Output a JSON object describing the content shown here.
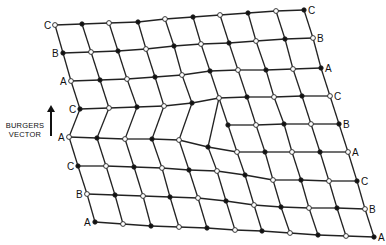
{
  "diagram": {
    "burgers_vector_label": [
      "BURGERS",
      "VECTOR"
    ],
    "colors": {
      "line": "#222222",
      "filled_node": "#111111",
      "open_node_fill": "#ffffff",
      "text": "#111111"
    },
    "left_labels": [
      "C",
      "B",
      "A",
      "C",
      "A",
      "C",
      "B",
      "A"
    ],
    "right_labels": [
      "C",
      "B",
      "A",
      "C",
      "B",
      "A",
      "C",
      "B",
      "A"
    ],
    "rows": [
      {
        "label_left": "C",
        "label_right": "C",
        "first_filled": false,
        "nodes": [
          [
            55,
            25
          ],
          [
            82,
            24
          ],
          [
            109,
            23
          ],
          [
            138,
            22
          ],
          [
            165,
            19
          ],
          [
            193,
            17
          ],
          [
            220,
            15
          ],
          [
            248,
            13
          ],
          [
            276,
            11
          ],
          [
            304,
            10
          ]
        ]
      },
      {
        "label_left": "B",
        "label_right": "B",
        "first_filled": true,
        "nodes": [
          [
            63,
            53
          ],
          [
            91,
            52
          ],
          [
            118,
            51
          ],
          [
            146,
            49
          ],
          [
            174,
            46
          ],
          [
            201,
            44
          ],
          [
            229,
            43
          ],
          [
            256,
            41
          ],
          [
            285,
            39
          ],
          [
            313,
            38
          ]
        ]
      },
      {
        "label_left": "A",
        "label_right": "A",
        "first_filled": false,
        "nodes": [
          [
            71,
            81
          ],
          [
            100,
            80
          ],
          [
            127,
            79
          ],
          [
            155,
            77
          ],
          [
            182,
            75
          ],
          [
            210,
            71
          ],
          [
            238,
            70
          ],
          [
            266,
            70
          ],
          [
            293,
            69
          ],
          [
            321,
            68
          ]
        ]
      },
      {
        "label_left": "C",
        "label_right": "C",
        "first_filled": true,
        "nodes": [
          [
            80,
            109
          ],
          [
            109,
            108
          ],
          [
            137,
            107
          ],
          [
            164,
            106
          ],
          [
            192,
            103
          ],
          [
            219,
            98
          ],
          [
            247,
            97
          ],
          [
            274,
            97
          ],
          [
            302,
            96
          ],
          [
            330,
            96
          ]
        ]
      },
      {
        "label_left": null,
        "label_right": "B",
        "first_filled": true,
        "half_plane": true,
        "nodes": [
          [
            228,
            125
          ],
          [
            256,
            125
          ],
          [
            284,
            124
          ],
          [
            311,
            124
          ],
          [
            339,
            124
          ]
        ]
      },
      {
        "label_left": "A",
        "label_right": "A",
        "first_filled": false,
        "nodes": [
          [
            69,
            137
          ],
          [
            97,
            138
          ],
          [
            125,
            139
          ],
          [
            152,
            139
          ],
          [
            179,
            140
          ],
          [
            208,
            147
          ],
          [
            237,
            152
          ],
          [
            265,
            152
          ],
          [
            292,
            152
          ],
          [
            320,
            152
          ],
          [
            348,
            152
          ]
        ]
      },
      {
        "label_left": "C",
        "label_right": "C",
        "first_filled": true,
        "nodes": [
          [
            78,
            166
          ],
          [
            106,
            166
          ],
          [
            134,
            167
          ],
          [
            162,
            168
          ],
          [
            189,
            170
          ],
          [
            217,
            171
          ],
          [
            245,
            175
          ],
          [
            273,
            180
          ],
          [
            301,
            180
          ],
          [
            329,
            181
          ],
          [
            357,
            181
          ]
        ]
      },
      {
        "label_left": "B",
        "label_right": "B",
        "first_filled": false,
        "nodes": [
          [
            87,
            194
          ],
          [
            115,
            195
          ],
          [
            143,
            196
          ],
          [
            170,
            197
          ],
          [
            198,
            198
          ],
          [
            226,
            201
          ],
          [
            254,
            205
          ],
          [
            281,
            207
          ],
          [
            309,
            208
          ],
          [
            337,
            208
          ],
          [
            365,
            209
          ]
        ]
      },
      {
        "label_left": "A",
        "label_right": "A",
        "first_filled": true,
        "nodes": [
          [
            95,
            222
          ],
          [
            123,
            224
          ],
          [
            151,
            226
          ],
          [
            179,
            227
          ],
          [
            207,
            228
          ],
          [
            235,
            230
          ],
          [
            262,
            231
          ],
          [
            290,
            233
          ],
          [
            318,
            235
          ],
          [
            346,
            236
          ],
          [
            374,
            237
          ]
        ]
      }
    ]
  }
}
